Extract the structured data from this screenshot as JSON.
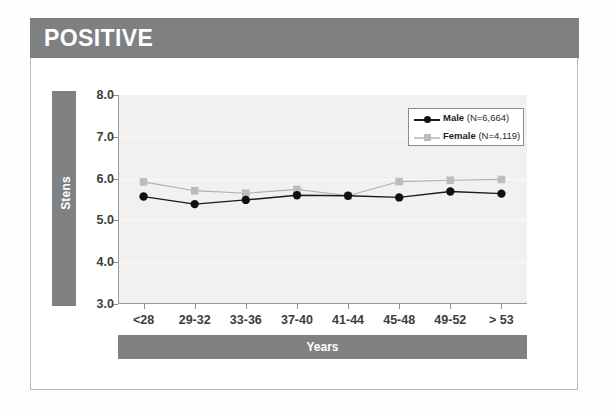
{
  "header": {
    "title": "POSITIVE"
  },
  "axes": {
    "y_title": "Stens",
    "x_title": "Years"
  },
  "chart_data": {
    "type": "line",
    "title": "POSITIVE",
    "xlabel": "Years",
    "ylabel": "Stens",
    "categories": [
      "<28",
      "29-32",
      "33-36",
      "37-40",
      "41-44",
      "45-48",
      "49-52",
      "> 53"
    ],
    "ylim": [
      3.0,
      8.0
    ],
    "yticks": [
      "3.0",
      "4.0",
      "5.0",
      "6.0",
      "7.0",
      "8.0"
    ],
    "ytick_values": [
      3.0,
      4.0,
      5.0,
      6.0,
      7.0,
      8.0
    ],
    "grid": true,
    "legend_position": "top-right",
    "series": [
      {
        "name": "Male",
        "legend_label": "Male (N=6,664)",
        "n": "6,664",
        "marker": "circle",
        "color": "#1a1a1a",
        "values": [
          5.57,
          5.39,
          5.49,
          5.6,
          5.59,
          5.55,
          5.69,
          5.64
        ]
      },
      {
        "name": "Female",
        "legend_label": "Female (N=4,119)",
        "n": "4,119",
        "marker": "square",
        "color": "#b0b0b0",
        "values": [
          5.92,
          5.71,
          5.65,
          5.74,
          5.59,
          5.93,
          5.96,
          5.98
        ]
      }
    ]
  },
  "legend": [
    {
      "name": "Male",
      "n_text": " (N=6,664)"
    },
    {
      "name": "Female",
      "n_text": " (N=4,119)"
    }
  ],
  "colors": {
    "bar_gray": "#808183",
    "plot_bg": "#f1f1f1",
    "male": "#1a1a1a",
    "female": "#b0b0b0"
  }
}
